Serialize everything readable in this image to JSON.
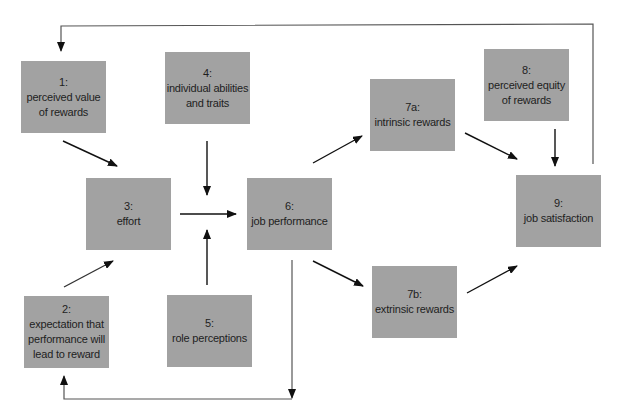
{
  "diagram": {
    "type": "flowchart",
    "nodes": [
      {
        "id": "1",
        "number": "1:",
        "lines": [
          "perceived value",
          "of rewards"
        ],
        "x": 21,
        "y": 61
      },
      {
        "id": "2",
        "number": "2:",
        "lines": [
          "expectation that",
          "performance will",
          "lead to reward"
        ],
        "x": 24,
        "y": 296
      },
      {
        "id": "3",
        "number": "3:",
        "lines": [
          "effort"
        ],
        "x": 86,
        "y": 178
      },
      {
        "id": "4",
        "number": "4:",
        "lines": [
          "individual abilities",
          "and traits"
        ],
        "x": 165,
        "y": 52
      },
      {
        "id": "5",
        "number": "5:",
        "lines": [
          "role perceptions"
        ],
        "x": 167,
        "y": 295
      },
      {
        "id": "6",
        "number": "6:",
        "lines": [
          "job performance"
        ],
        "x": 247,
        "y": 178
      },
      {
        "id": "7a",
        "number": "7a:",
        "lines": [
          "intrinsic rewards"
        ],
        "x": 370,
        "y": 79
      },
      {
        "id": "7b",
        "number": "7b:",
        "lines": [
          "extrinsic rewards"
        ],
        "x": 372,
        "y": 266
      },
      {
        "id": "8",
        "number": "8:",
        "lines": [
          "perceived equity",
          "of rewards"
        ],
        "x": 484,
        "y": 49
      },
      {
        "id": "9",
        "number": "9:",
        "lines": [
          "job satisfaction"
        ],
        "x": 516,
        "y": 175
      }
    ],
    "edges": [
      {
        "from": "1",
        "to": "3"
      },
      {
        "from": "2",
        "to": "3"
      },
      {
        "from": "4",
        "to": "6"
      },
      {
        "from": "5",
        "to": "6"
      },
      {
        "from": "3",
        "to": "6"
      },
      {
        "from": "6",
        "to": "7a"
      },
      {
        "from": "6",
        "to": "7b"
      },
      {
        "from": "7a",
        "to": "9"
      },
      {
        "from": "7b",
        "to": "9"
      },
      {
        "from": "8",
        "to": "9"
      },
      {
        "from": "9",
        "to": "1",
        "routing": "feedback loop along top"
      },
      {
        "from": "6",
        "to": "2",
        "routing": "feedback loop along bottom"
      }
    ],
    "colors": {
      "box_fill": "#a2a2a2",
      "text": "#1e1e1e",
      "arrow": "#111111",
      "feedback_line": "#555555",
      "background": "#ffffff"
    }
  }
}
